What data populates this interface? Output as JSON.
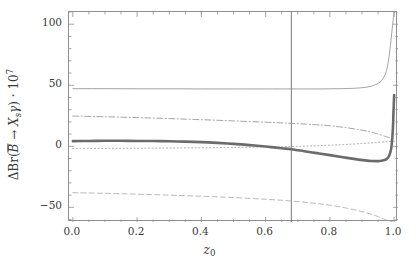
{
  "chart_data": {
    "type": "line",
    "title": "",
    "xlabel": "z_0",
    "ylabel": "ΔBr(B̄ → X_s γ) · 10^7",
    "xlim": [
      -0.012,
      1.012
    ],
    "ylim": [
      -62,
      110
    ],
    "grid": false,
    "legend": "none",
    "xticks": [
      0.0,
      0.2,
      0.4,
      0.6,
      0.8,
      1.0
    ],
    "xtick_labels": [
      "0.0",
      "0.2",
      "0.4",
      "0.6",
      "0.8",
      "1.0"
    ],
    "yticks": [
      -50,
      0,
      50,
      100
    ],
    "ytick_labels": [
      "-50",
      "0",
      "50",
      "100"
    ],
    "annotations": [
      {
        "name": "vertical-reference-line",
        "type": "vline",
        "x": 0.68
      }
    ],
    "series": [
      {
        "name": "thin-solid-upper",
        "style": "solid",
        "width": 0.8,
        "color": "#8c8c8c",
        "x": [
          0.0,
          0.1,
          0.2,
          0.3,
          0.4,
          0.5,
          0.6,
          0.68,
          0.75,
          0.8,
          0.85,
          0.88,
          0.91,
          0.93,
          0.95,
          0.96,
          0.97,
          0.975,
          0.98,
          0.985,
          0.99,
          0.995,
          1.0
        ],
        "y": [
          47.2,
          47.2,
          47.1,
          47.1,
          47.0,
          47.0,
          47.0,
          47.0,
          47.0,
          47.1,
          47.3,
          47.6,
          48.3,
          49.3,
          51.5,
          53.6,
          57.5,
          61.0,
          66.5,
          75.0,
          86.5,
          99.0,
          110.0
        ]
      },
      {
        "name": "dash-dot-upper",
        "style": "dashdot",
        "width": 0.9,
        "color": "#9a9a9a",
        "x": [
          0.0,
          0.1,
          0.2,
          0.3,
          0.4,
          0.5,
          0.6,
          0.68,
          0.75,
          0.8,
          0.85,
          0.9,
          0.93,
          0.95,
          0.97,
          0.98,
          0.99,
          1.0
        ],
        "y": [
          24.8,
          24.2,
          23.5,
          22.7,
          21.8,
          20.8,
          19.7,
          18.8,
          17.8,
          16.8,
          15.3,
          13.2,
          11.5,
          10.0,
          8.3,
          7.5,
          7.0,
          6.8
        ]
      },
      {
        "name": "dotted-center",
        "style": "dotted",
        "width": 0.9,
        "color": "#9a9a9a",
        "x": [
          0.0,
          0.1,
          0.2,
          0.3,
          0.4,
          0.5,
          0.6,
          0.68,
          0.75,
          0.8,
          0.85,
          0.9,
          0.93,
          0.95,
          0.97,
          0.98,
          0.99,
          1.0
        ],
        "y": [
          -1.8,
          -1.7,
          -1.6,
          -1.4,
          -1.2,
          -0.9,
          -0.5,
          -0.1,
          0.4,
          0.9,
          1.5,
          2.3,
          2.8,
          3.2,
          3.6,
          3.8,
          3.9,
          4.0
        ]
      },
      {
        "name": "thick-solid-main",
        "style": "solid",
        "width": 2.6,
        "color": "#6b6b6b",
        "x": [
          0.0,
          0.05,
          0.1,
          0.15,
          0.2,
          0.25,
          0.3,
          0.35,
          0.4,
          0.45,
          0.5,
          0.55,
          0.6,
          0.65,
          0.68,
          0.72,
          0.76,
          0.8,
          0.84,
          0.88,
          0.91,
          0.93,
          0.95,
          0.96,
          0.97,
          0.975,
          0.98,
          0.985,
          0.99,
          0.993,
          0.996,
          0.998,
          1.0
        ],
        "y": [
          4.2,
          4.4,
          4.5,
          4.5,
          4.4,
          4.3,
          4.1,
          3.8,
          3.4,
          2.8,
          2.0,
          1.0,
          -0.2,
          -1.6,
          -2.4,
          -4.0,
          -5.6,
          -7.2,
          -8.9,
          -10.5,
          -11.5,
          -12.0,
          -12.1,
          -11.9,
          -11.3,
          -10.7,
          -9.6,
          -7.4,
          -3.0,
          3.0,
          14.0,
          28.0,
          42.0
        ]
      },
      {
        "name": "dashed-lower",
        "style": "dashed",
        "width": 0.9,
        "color": "#b0b0b0",
        "x": [
          0.0,
          0.1,
          0.2,
          0.3,
          0.4,
          0.5,
          0.6,
          0.68,
          0.75,
          0.8,
          0.85,
          0.9,
          0.93,
          0.95,
          0.97,
          0.98,
          0.99,
          1.0
        ],
        "y": [
          -38.0,
          -38.5,
          -39.2,
          -40.0,
          -40.9,
          -42.0,
          -43.4,
          -44.8,
          -46.6,
          -48.2,
          -50.5,
          -53.5,
          -55.8,
          -57.6,
          -59.7,
          -60.8,
          -61.6,
          -62.2
        ]
      }
    ]
  },
  "axis_colors": {
    "frame": "#909090",
    "tick": "#909090",
    "vline": "#6a6a6a"
  },
  "labels": {
    "y_title_parts": {
      "delta": "Δ",
      "br": "Br(",
      "bbar": "B",
      "arrow": " → ",
      "x": "X",
      "xsub": "s",
      "gamma": "γ",
      "close": ") · 10",
      "exp": "7"
    },
    "x_title_parts": {
      "z": "z",
      "zsub": "0"
    }
  }
}
